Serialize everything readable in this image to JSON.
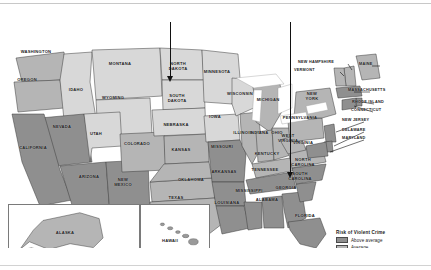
{
  "map": {
    "title_from_legend": "Risk of Violent Crime",
    "projection_note": "contiguous United States choropleth, grayscale",
    "colors": {
      "above_average": "#8f8f8f",
      "average": "#b5b5b5",
      "below_average": "#d8d8d8",
      "water": "#ffffff",
      "border": "#3a3a3a",
      "annotation": "#111111"
    },
    "legend": {
      "title": "Risk of Violent Crime",
      "items": [
        {
          "label": "Above average",
          "swatch": "#8f8f8f"
        },
        {
          "label": "Average",
          "swatch": "#b5b5b5"
        },
        {
          "label": "Below average",
          "swatch": "#d8d8d8"
        }
      ]
    },
    "annotations": [
      {
        "name": "arrow-north-dakota",
        "target": "NORTH DAKOTA",
        "x": 170,
        "top": 0,
        "bottom": 62
      },
      {
        "name": "arrow-north-carolina",
        "target": "NORTH CAROLINA",
        "x": 290,
        "top": 0,
        "bottom": 158
      }
    ],
    "insets": [
      {
        "name": "alaska",
        "label": "ALASKA"
      },
      {
        "name": "hawaii",
        "label": "HAWAII"
      }
    ],
    "states": [
      {
        "name": "WASHINGTON",
        "x": 36,
        "y": 50,
        "risk": "average"
      },
      {
        "name": "OREGON",
        "x": 27,
        "y": 78,
        "risk": "average"
      },
      {
        "name": "IDAHO",
        "x": 76,
        "y": 88,
        "risk": "below_average"
      },
      {
        "name": "MONTANA",
        "x": 120,
        "y": 62,
        "risk": "below_average"
      },
      {
        "name": "WYOMING",
        "x": 113,
        "y": 96,
        "risk": "below_average"
      },
      {
        "name": "NEVADA",
        "x": 62,
        "y": 125,
        "risk": "above_average"
      },
      {
        "name": "UTAH",
        "x": 96,
        "y": 132,
        "risk": "below_average"
      },
      {
        "name": "CALIFORNIA",
        "x": 33,
        "y": 146,
        "risk": "above_average"
      },
      {
        "name": "ARIZONA",
        "x": 89,
        "y": 175,
        "risk": "above_average"
      },
      {
        "name": "NEW\nMEXICO",
        "x": 123,
        "y": 178,
        "risk": "above_average"
      },
      {
        "name": "COLORADO",
        "x": 137,
        "y": 142,
        "risk": "average"
      },
      {
        "name": "NORTH\nDAKOTA",
        "x": 178,
        "y": 62,
        "risk": "below_average"
      },
      {
        "name": "SOUTH\nDAKOTA",
        "x": 177,
        "y": 94,
        "risk": "below_average"
      },
      {
        "name": "NEBRASKA",
        "x": 176,
        "y": 123,
        "risk": "below_average"
      },
      {
        "name": "KANSAS",
        "x": 181,
        "y": 148,
        "risk": "average"
      },
      {
        "name": "OKLAHOMA",
        "x": 191,
        "y": 178,
        "risk": "average"
      },
      {
        "name": "TEXAS",
        "x": 176,
        "y": 196,
        "risk": "average"
      },
      {
        "name": "MINNESOTA",
        "x": 217,
        "y": 70,
        "risk": "below_average"
      },
      {
        "name": "IOWA",
        "x": 215,
        "y": 115,
        "risk": "below_average"
      },
      {
        "name": "MISSOURI",
        "x": 222,
        "y": 145,
        "risk": "above_average"
      },
      {
        "name": "ARKANSAS",
        "x": 224,
        "y": 170,
        "risk": "above_average"
      },
      {
        "name": "LOUISIANA",
        "x": 227,
        "y": 201,
        "risk": "above_average"
      },
      {
        "name": "WISCONSIN",
        "x": 240,
        "y": 92,
        "risk": "below_average"
      },
      {
        "name": "ILLINOIS",
        "x": 243,
        "y": 131,
        "risk": "average"
      },
      {
        "name": "MISSISSIPPI",
        "x": 249,
        "y": 189,
        "risk": "above_average"
      },
      {
        "name": "MICHIGAN",
        "x": 268,
        "y": 98,
        "risk": "average"
      },
      {
        "name": "INDIANA",
        "x": 259,
        "y": 131,
        "risk": "average"
      },
      {
        "name": "OHIO",
        "x": 277,
        "y": 131,
        "risk": "average"
      },
      {
        "name": "KENTUCKY",
        "x": 267,
        "y": 152,
        "risk": "average"
      },
      {
        "name": "TENNESSEE",
        "x": 265,
        "y": 168,
        "risk": "above_average"
      },
      {
        "name": "ALABAMA",
        "x": 267,
        "y": 198,
        "risk": "above_average"
      },
      {
        "name": "GEORGIA",
        "x": 286,
        "y": 186,
        "risk": "above_average"
      },
      {
        "name": "FLORIDA",
        "x": 305,
        "y": 214,
        "risk": "above_average"
      },
      {
        "name": "SOUTH\nCAROLINA",
        "x": 300,
        "y": 172,
        "risk": "above_average"
      },
      {
        "name": "NORTH\nCAROLINA",
        "x": 303,
        "y": 158,
        "risk": "above_average"
      },
      {
        "name": "VIRGINIA",
        "x": 303,
        "y": 141,
        "risk": "average"
      },
      {
        "name": "WEST\nVIRGINIA",
        "x": 288,
        "y": 134,
        "risk": "average"
      },
      {
        "name": "PENNSYLVANIA",
        "x": 300,
        "y": 116,
        "risk": "average"
      },
      {
        "name": "NEW\nYORK",
        "x": 312,
        "y": 92,
        "risk": "average"
      }
    ],
    "callout_states": [
      {
        "name": "NEW HAMPSHIRE",
        "x": 322,
        "y": 60
      },
      {
        "name": "VERMONT",
        "x": 318,
        "y": 68
      },
      {
        "name": "MAINE",
        "x": 383,
        "y": 62
      },
      {
        "name": "MASSACHUSETTS",
        "x": 372,
        "y": 88
      },
      {
        "name": "RHODE ISLAND",
        "x": 376,
        "y": 100
      },
      {
        "name": "CONNECTICUT",
        "x": 375,
        "y": 108
      },
      {
        "name": "NEW JERSEY",
        "x": 366,
        "y": 118
      },
      {
        "name": "DELAWARE",
        "x": 366,
        "y": 128
      },
      {
        "name": "MARYLAND",
        "x": 366,
        "y": 136
      }
    ]
  }
}
